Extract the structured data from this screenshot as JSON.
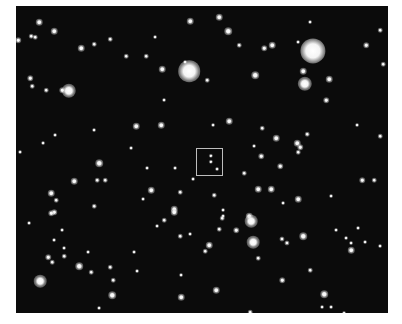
{
  "image": {
    "description": "Star field photograph with a highlighted square region",
    "background_color": "#0b0b0b",
    "frame": {
      "left": 16,
      "top": 6,
      "width": 372,
      "height": 307
    }
  },
  "marker_box": {
    "x": 196,
    "y": 148,
    "width": 27,
    "height": 28,
    "color": "#bdbdbd"
  },
  "stars": [
    {
      "x": 313,
      "y": 51,
      "r": 7
    },
    {
      "x": 189,
      "y": 71,
      "r": 6
    },
    {
      "x": 305,
      "y": 84,
      "r": 4
    },
    {
      "x": 303,
      "y": 71,
      "r": 2.5
    },
    {
      "x": 272,
      "y": 45,
      "r": 2.5
    },
    {
      "x": 329,
      "y": 79,
      "r": 2.5
    },
    {
      "x": 326,
      "y": 100,
      "r": 2
    },
    {
      "x": 366,
      "y": 45,
      "r": 2
    },
    {
      "x": 380,
      "y": 30,
      "r": 1.5
    },
    {
      "x": 383,
      "y": 64,
      "r": 1.5
    },
    {
      "x": 298,
      "y": 42,
      "r": 1.2
    },
    {
      "x": 310,
      "y": 22,
      "r": 1.2
    },
    {
      "x": 190,
      "y": 21,
      "r": 2.5
    },
    {
      "x": 219,
      "y": 17,
      "r": 2.5
    },
    {
      "x": 228,
      "y": 31,
      "r": 3
    },
    {
      "x": 162,
      "y": 69,
      "r": 2.5
    },
    {
      "x": 255,
      "y": 75,
      "r": 3
    },
    {
      "x": 239,
      "y": 45,
      "r": 1.5
    },
    {
      "x": 264,
      "y": 48,
      "r": 2
    },
    {
      "x": 155,
      "y": 37,
      "r": 1.2
    },
    {
      "x": 185,
      "y": 62,
      "r": 1.2
    },
    {
      "x": 207,
      "y": 80,
      "r": 1.5
    },
    {
      "x": 164,
      "y": 100,
      "r": 1.2
    },
    {
      "x": 146,
      "y": 56,
      "r": 1.5
    },
    {
      "x": 39,
      "y": 22,
      "r": 2.5
    },
    {
      "x": 54,
      "y": 31,
      "r": 2.5
    },
    {
      "x": 18,
      "y": 40,
      "r": 2
    },
    {
      "x": 31,
      "y": 36,
      "r": 1.5
    },
    {
      "x": 35,
      "y": 37,
      "r": 1.5
    },
    {
      "x": 81,
      "y": 48,
      "r": 2.5
    },
    {
      "x": 94,
      "y": 44,
      "r": 1.5
    },
    {
      "x": 69,
      "y": 91,
      "r": 4
    },
    {
      "x": 62,
      "y": 90,
      "r": 2
    },
    {
      "x": 46,
      "y": 90,
      "r": 1.5
    },
    {
      "x": 30,
      "y": 78,
      "r": 2
    },
    {
      "x": 32,
      "y": 86,
      "r": 1.5
    },
    {
      "x": 110,
      "y": 39,
      "r": 1.5
    },
    {
      "x": 126,
      "y": 56,
      "r": 1.5
    },
    {
      "x": 99,
      "y": 163,
      "r": 3
    },
    {
      "x": 74,
      "y": 181,
      "r": 2.5
    },
    {
      "x": 51,
      "y": 193,
      "r": 2.5
    },
    {
      "x": 56,
      "y": 200,
      "r": 1.5
    },
    {
      "x": 97,
      "y": 180,
      "r": 1.5
    },
    {
      "x": 105,
      "y": 180,
      "r": 1.5
    },
    {
      "x": 136,
      "y": 126,
      "r": 2.5
    },
    {
      "x": 131,
      "y": 148,
      "r": 1.2
    },
    {
      "x": 143,
      "y": 199,
      "r": 1.2
    },
    {
      "x": 94,
      "y": 206,
      "r": 1.5
    },
    {
      "x": 54,
      "y": 212,
      "r": 2
    },
    {
      "x": 55,
      "y": 135,
      "r": 1.2
    },
    {
      "x": 94,
      "y": 130,
      "r": 1.2
    },
    {
      "x": 43,
      "y": 143,
      "r": 1.2
    },
    {
      "x": 20,
      "y": 152,
      "r": 1.2
    },
    {
      "x": 161,
      "y": 125,
      "r": 2.5
    },
    {
      "x": 229,
      "y": 121,
      "r": 2.5
    },
    {
      "x": 213,
      "y": 125,
      "r": 1.2
    },
    {
      "x": 151,
      "y": 190,
      "r": 2.5
    },
    {
      "x": 180,
      "y": 192,
      "r": 1.5
    },
    {
      "x": 214,
      "y": 195,
      "r": 1.5
    },
    {
      "x": 175,
      "y": 168,
      "r": 1.2
    },
    {
      "x": 147,
      "y": 168,
      "r": 1.2
    },
    {
      "x": 244,
      "y": 173,
      "r": 1.5
    },
    {
      "x": 258,
      "y": 189,
      "r": 2.5
    },
    {
      "x": 261,
      "y": 156,
      "r": 2
    },
    {
      "x": 254,
      "y": 146,
      "r": 1.2
    },
    {
      "x": 262,
      "y": 128,
      "r": 1.5
    },
    {
      "x": 249,
      "y": 216,
      "r": 2.5
    },
    {
      "x": 174,
      "y": 209,
      "r": 2.5
    },
    {
      "x": 223,
      "y": 216,
      "r": 1.2
    },
    {
      "x": 193,
      "y": 179,
      "r": 1.2
    },
    {
      "x": 211,
      "y": 156,
      "r": 1.4
    },
    {
      "x": 211,
      "y": 162,
      "r": 1.4
    },
    {
      "x": 217,
      "y": 169,
      "r": 1.2
    },
    {
      "x": 276,
      "y": 138,
      "r": 2.5
    },
    {
      "x": 297,
      "y": 143,
      "r": 2.5
    },
    {
      "x": 300,
      "y": 147,
      "r": 2
    },
    {
      "x": 298,
      "y": 152,
      "r": 1.5
    },
    {
      "x": 307,
      "y": 134,
      "r": 1.5
    },
    {
      "x": 280,
      "y": 166,
      "r": 2
    },
    {
      "x": 271,
      "y": 189,
      "r": 2.5
    },
    {
      "x": 298,
      "y": 199,
      "r": 2.5
    },
    {
      "x": 362,
      "y": 180,
      "r": 2
    },
    {
      "x": 374,
      "y": 180,
      "r": 1.5
    },
    {
      "x": 357,
      "y": 125,
      "r": 1.2
    },
    {
      "x": 380,
      "y": 136,
      "r": 1.5
    },
    {
      "x": 331,
      "y": 196,
      "r": 1.2
    },
    {
      "x": 283,
      "y": 203,
      "r": 1.2
    },
    {
      "x": 51,
      "y": 213,
      "r": 2
    },
    {
      "x": 29,
      "y": 223,
      "r": 1.2
    },
    {
      "x": 79,
      "y": 266,
      "r": 3
    },
    {
      "x": 40,
      "y": 281,
      "r": 3.5
    },
    {
      "x": 48,
      "y": 257,
      "r": 2
    },
    {
      "x": 52,
      "y": 262,
      "r": 1.5
    },
    {
      "x": 64,
      "y": 256,
      "r": 1.5
    },
    {
      "x": 54,
      "y": 240,
      "r": 1.2
    },
    {
      "x": 112,
      "y": 295,
      "r": 3
    },
    {
      "x": 91,
      "y": 272,
      "r": 1.5
    },
    {
      "x": 110,
      "y": 267,
      "r": 1.5
    },
    {
      "x": 113,
      "y": 280,
      "r": 1.5
    },
    {
      "x": 64,
      "y": 248,
      "r": 1.2
    },
    {
      "x": 88,
      "y": 252,
      "r": 1.2
    },
    {
      "x": 134,
      "y": 252,
      "r": 1.2
    },
    {
      "x": 137,
      "y": 271,
      "r": 1.2
    },
    {
      "x": 99,
      "y": 308,
      "r": 1.2
    },
    {
      "x": 62,
      "y": 230,
      "r": 1.2
    },
    {
      "x": 174,
      "y": 212,
      "r": 2.5
    },
    {
      "x": 164,
      "y": 220,
      "r": 1.5
    },
    {
      "x": 222,
      "y": 218,
      "r": 1.5
    },
    {
      "x": 223,
      "y": 210,
      "r": 1.2
    },
    {
      "x": 251,
      "y": 221,
      "r": 3.5
    },
    {
      "x": 253,
      "y": 242,
      "r": 3.5
    },
    {
      "x": 219,
      "y": 229,
      "r": 1.5
    },
    {
      "x": 236,
      "y": 230,
      "r": 2
    },
    {
      "x": 209,
      "y": 245,
      "r": 2.5
    },
    {
      "x": 205,
      "y": 251,
      "r": 1.5
    },
    {
      "x": 180,
      "y": 236,
      "r": 1.5
    },
    {
      "x": 157,
      "y": 226,
      "r": 1.2
    },
    {
      "x": 190,
      "y": 234,
      "r": 1.2
    },
    {
      "x": 258,
      "y": 258,
      "r": 1.5
    },
    {
      "x": 181,
      "y": 275,
      "r": 1.2
    },
    {
      "x": 216,
      "y": 290,
      "r": 2.5
    },
    {
      "x": 181,
      "y": 297,
      "r": 2.5
    },
    {
      "x": 250,
      "y": 312,
      "r": 1.5
    },
    {
      "x": 303,
      "y": 236,
      "r": 3
    },
    {
      "x": 282,
      "y": 239,
      "r": 1.8
    },
    {
      "x": 287,
      "y": 243,
      "r": 1.8
    },
    {
      "x": 346,
      "y": 238,
      "r": 1.2
    },
    {
      "x": 351,
      "y": 243,
      "r": 1.2
    },
    {
      "x": 336,
      "y": 230,
      "r": 1.2
    },
    {
      "x": 358,
      "y": 228,
      "r": 1.2
    },
    {
      "x": 365,
      "y": 242,
      "r": 1.2
    },
    {
      "x": 351,
      "y": 250,
      "r": 2.5
    },
    {
      "x": 380,
      "y": 246,
      "r": 1.2
    },
    {
      "x": 310,
      "y": 270,
      "r": 1.5
    },
    {
      "x": 282,
      "y": 280,
      "r": 2
    },
    {
      "x": 324,
      "y": 294,
      "r": 3
    },
    {
      "x": 322,
      "y": 307,
      "r": 1.2
    },
    {
      "x": 331,
      "y": 307,
      "r": 1.2
    },
    {
      "x": 344,
      "y": 313,
      "r": 1.2
    }
  ]
}
